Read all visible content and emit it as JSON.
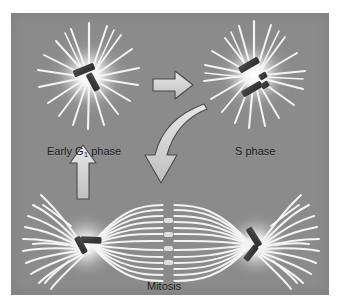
{
  "figure": {
    "title_present": false,
    "panel_background": "#8b8b8b",
    "frame_background": "#ffffff",
    "label_color": "#1d1d1d",
    "microtubule_color": "#f2f2f2",
    "centriole_color": "#3a3a3a",
    "arrow_fill": "#d8d8d8",
    "arrow_stroke": "#4a4a4a",
    "aster_glow_color": "#ffffff"
  },
  "labels": {
    "early_g1": {
      "prefix": "Early G",
      "subscript": "1",
      "suffix": " phase",
      "full": "Early G1 phase"
    },
    "s_phase": "S phase",
    "mitosis": "Mitosis"
  },
  "stages": [
    {
      "id": "early-g1",
      "label": "Early G1 phase",
      "position": "top-left",
      "centrosomes": 1,
      "centriole_pairs": 1,
      "centriole_arrangement": "orthogonal-pair",
      "aster_spokes": 20,
      "description": "Single centrosome with one orthogonal centriole pair, radiating aster"
    },
    {
      "id": "s-phase",
      "label": "S phase",
      "position": "top-right",
      "centrosomes": 1,
      "centriole_pairs": 2,
      "centriole_arrangement": "duplicated-mother-daughter",
      "aster_spokes": 22,
      "description": "Centrioles duplicated: two mother centrioles each with a small daughter"
    },
    {
      "id": "mitosis",
      "label": "Mitosis",
      "position": "bottom",
      "centrosomes": 2,
      "centriole_pairs": 2,
      "centriole_arrangement": "orthogonal-pair-per-pole",
      "spindle_fibers": 13,
      "astral_fibers_per_pole": 13,
      "description": "Two spindle poles connected by bipolar spindle with central metaphase gap"
    }
  ],
  "arrows": [
    {
      "id": "g1-to-s",
      "from": "early-g1",
      "to": "s-phase",
      "style": "straight-block",
      "direction": "right"
    },
    {
      "id": "s-to-mitosis",
      "from": "s-phase",
      "to": "mitosis",
      "style": "curved-block",
      "direction": "down-left-then-down"
    },
    {
      "id": "mitosis-to-g1",
      "from": "mitosis",
      "to": "early-g1",
      "style": "straight-block",
      "direction": "up"
    }
  ]
}
